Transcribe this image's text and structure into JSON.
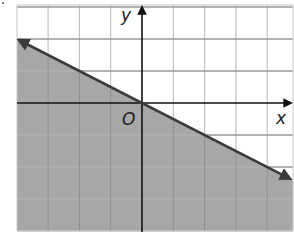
{
  "chart_data": {
    "type": "line",
    "title": "",
    "xlabel": "x",
    "ylabel": "y",
    "origin_label": "O",
    "xlim": [
      -4,
      4.8
    ],
    "ylim": [
      -4,
      3.1
    ],
    "grid": true,
    "grid_step": 1,
    "tick_labels_shown": false,
    "series": [
      {
        "name": "boundary",
        "equation": "y = -x/2",
        "slope": -0.5,
        "intercept": 0,
        "style": "solid",
        "arrows": "both",
        "x": [
          -4,
          0,
          4.8
        ],
        "y": [
          2,
          0,
          -2.4
        ]
      }
    ],
    "shaded_region": "below boundary line",
    "inequality": "y ≤ -1/2 x",
    "colors": {
      "shade": "#a7a7a7",
      "line": "#3a3a3a",
      "grid": "#b5b5b5",
      "axes": "#111111"
    }
  },
  "labels": {
    "x_axis": "x",
    "y_axis": "y",
    "origin": "O"
  }
}
